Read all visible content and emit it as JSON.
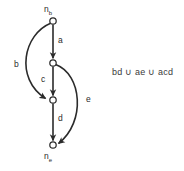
{
  "diagram": {
    "type": "directed-graph",
    "nodes": [
      {
        "id": "nb",
        "label": "n",
        "subscript": "b",
        "x": 53,
        "y": 21,
        "label_x": 44,
        "label_y": 5
      },
      {
        "id": "n2",
        "label": "",
        "subscript": "",
        "x": 53,
        "y": 63
      },
      {
        "id": "n3",
        "label": "",
        "subscript": "",
        "x": 53,
        "y": 100
      },
      {
        "id": "ne",
        "label": "n",
        "subscript": "e",
        "x": 53,
        "y": 145,
        "label_x": 44,
        "label_y": 152
      }
    ],
    "edges": [
      {
        "id": "a",
        "label": "a",
        "from": "nb",
        "to": "n2",
        "shape": "straight",
        "label_x": 58,
        "label_y": 36
      },
      {
        "id": "b",
        "label": "b",
        "from": "nb",
        "to": "n3",
        "shape": "curve-left",
        "label_x": 14,
        "label_y": 60
      },
      {
        "id": "c",
        "label": "c",
        "from": "n2",
        "to": "n3",
        "shape": "straight",
        "label_x": 41,
        "label_y": 75
      },
      {
        "id": "d",
        "label": "d",
        "from": "n3",
        "to": "ne",
        "shape": "straight",
        "label_x": 58,
        "label_y": 114
      },
      {
        "id": "e",
        "label": "e",
        "from": "n2",
        "to": "ne",
        "shape": "curve-right",
        "label_x": 86,
        "label_y": 95
      }
    ],
    "node_style": {
      "radius": 3.2,
      "stroke": "#2b2b2b",
      "fill": "#ffffff"
    },
    "edge_style": {
      "stroke": "#2b2b2b",
      "width": 1.6
    }
  },
  "formula": {
    "text": "bd ∪ ae ∪ acd",
    "terms": [
      "bd",
      "ae",
      "acd"
    ],
    "operator": "∪"
  }
}
